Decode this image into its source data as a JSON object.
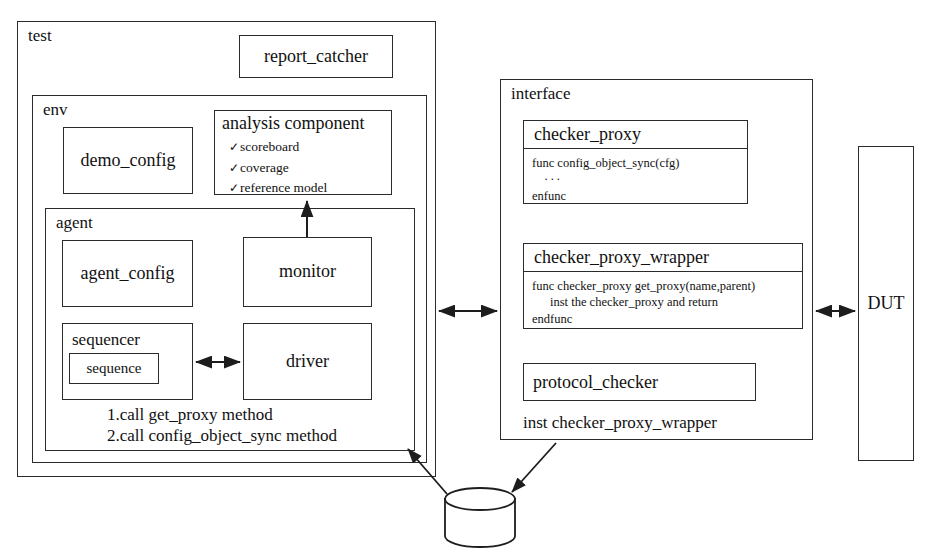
{
  "diagram": {
    "stroke_color": "#2b2b2b",
    "background_color": "#ffffff"
  },
  "test": {
    "label": "test",
    "report_catcher": {
      "label": "report_catcher"
    },
    "env": {
      "label": "env",
      "demo_config": {
        "label": "demo_config"
      },
      "analysis_component": {
        "label": "analysis component",
        "check_glyph": "✓",
        "items": [
          "scoreboard",
          "coverage",
          "reference model"
        ]
      },
      "agent": {
        "label": "agent",
        "agent_config": {
          "label": "agent_config"
        },
        "monitor": {
          "label": "monitor"
        },
        "sequencer": {
          "label": "sequencer",
          "sequence": {
            "label": "sequence"
          }
        },
        "driver": {
          "label": "driver"
        },
        "call_notes": [
          "1.call get_proxy method",
          "2.call config_object_sync method"
        ]
      }
    }
  },
  "interface": {
    "label": "interface",
    "checker_proxy": {
      "header": "checker_proxy",
      "body": [
        "func config_object_sync(cfg)",
        "···",
        "enfunc"
      ]
    },
    "checker_proxy_wrapper": {
      "header": "checker_proxy_wrapper",
      "body": [
        "func checker_proxy get_proxy(name,parent)",
        "inst the checker_proxy and return",
        "endfunc"
      ]
    },
    "protocol_checker": {
      "label": "protocol_checker"
    },
    "inst_note": "inst checker_proxy_wrapper"
  },
  "dut": {
    "label": "DUT"
  },
  "config_db": {
    "label": "config_db"
  },
  "connectors": {
    "monitor_to_analysis": "monitor-to-analysis-component-arrow",
    "sequencer_to_driver": "sequencer-to-driver-bidirectional-arrow",
    "test_to_interface": "test-to-interface-bidirectional-arrow",
    "interface_to_dut": "interface-to-dut-bidirectional-arrow",
    "configdb_to_agent": "config-db-to-agent-arrow",
    "interface_to_configdb": "interface-to-config-db-arrow"
  }
}
